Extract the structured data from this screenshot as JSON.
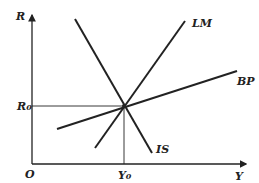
{
  "diagram": {
    "type": "IS-LM-BP",
    "axes": {
      "y_label": "R",
      "x_label": "Y",
      "origin_label": "O"
    },
    "curves": [
      {
        "name": "IS",
        "label": "IS",
        "x1": 75,
        "y1": 19,
        "x2": 152,
        "y2": 153
      },
      {
        "name": "LM",
        "label": "LM",
        "x1": 95,
        "y1": 148,
        "x2": 185,
        "y2": 21
      },
      {
        "name": "BP",
        "label": "BP",
        "x1": 57,
        "y1": 129,
        "x2": 237,
        "y2": 71
      }
    ],
    "equilibrium": {
      "r_label": "R",
      "r_sub": "0",
      "y_label": "Y",
      "y_sub": "0"
    },
    "colors": {
      "line": "#222222",
      "background": "#ffffff"
    }
  }
}
